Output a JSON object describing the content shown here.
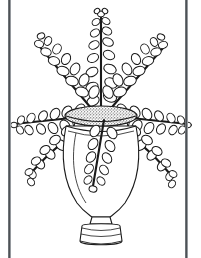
{
  "page": {
    "title": "Plant in Vase",
    "kind": "line-drawing",
    "background_color": "#ffffff",
    "ink_color": "#1a1a1a",
    "width": 201,
    "height": 258
  },
  "frame": {
    "left_rule_label": "left border rule",
    "right_rule_label": "right border rule",
    "color": "#3c4043",
    "left_x": 8,
    "right_x": 185,
    "thickness": 3
  },
  "artwork": {
    "subject": "potted plant with oval leaves in a footed vase",
    "style": "black outline coloring page, no fill",
    "stroke_color": "#1a1a1a",
    "fill_color": "#ffffff",
    "vase": {
      "label": "vase",
      "mouth_label": "vase-mouth-band",
      "mouth_texture": "stipple",
      "mouth_center_x": 101,
      "mouth_center_y": 115,
      "mouth_rx": 36,
      "mouth_ry": 9,
      "collar_y": 127,
      "body_top_y": 128,
      "body_bottom_y": 214,
      "body_max_halfwidth": 38,
      "stem_waist_y": 216,
      "foot_top_y": 222,
      "foot_bottom_y": 244,
      "foot_halfwidth": 20
    },
    "branches": [
      {
        "name": "branch-top-center",
        "angle_deg": -90,
        "length": 102,
        "leaf_pairs": 7
      },
      {
        "name": "branch-upper-left",
        "angle_deg": -142,
        "length": 86,
        "leaf_pairs": 6
      },
      {
        "name": "branch-upper-right",
        "angle_deg": -38,
        "length": 88,
        "leaf_pairs": 6
      },
      {
        "name": "branch-mid-left",
        "angle_deg": -168,
        "length": 88,
        "leaf_pairs": 6
      },
      {
        "name": "branch-mid-right",
        "angle_deg": -12,
        "length": 88,
        "leaf_pairs": 6
      },
      {
        "name": "branch-lower-left",
        "angle_deg": 152,
        "length": 80,
        "leaf_pairs": 6
      },
      {
        "name": "branch-lower-right",
        "angle_deg": 28,
        "length": 84,
        "leaf_pairs": 6
      },
      {
        "name": "branch-front-drape",
        "angle_deg": 80,
        "length": 86,
        "leaf_pairs": 6
      }
    ],
    "leaf": {
      "shape": "oval",
      "length": 11,
      "width": 8
    }
  }
}
